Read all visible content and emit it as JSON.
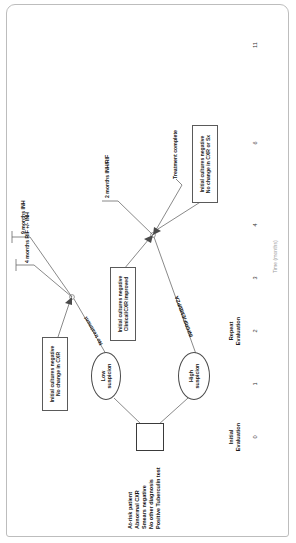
{
  "caption": {
    "text": "FIGURE 2. Treatment algorithm for suspected pulmonary tuberculosis with negative sputum smears"
  },
  "figure": {
    "orientation": "rotated-90-ccw"
  },
  "start": {
    "patient_criteria": "At-risk patient\nAbnormal CXR\nSmears negative\nNo other diagnosis\nPositive Tuberculin test"
  },
  "decisions": [
    {
      "id": "low",
      "label": "Low\nsuspicion"
    },
    {
      "id": "high",
      "label": "High\nsuspicion"
    }
  ],
  "paths": {
    "no_treatment": "No treatment",
    "initial_regimen": "INH/RIF/EMB/PZA",
    "two_months": "2 months INH/RIF",
    "four_months": "4 months RIF +/- INH",
    "nine_months": "9 months INH",
    "treatment_complete": "Treatment complete"
  },
  "outcome_boxes": [
    {
      "id": "low-outcome",
      "text": "Initial cultures negative\nNo change in CXR"
    },
    {
      "id": "repeat-outcome",
      "text": "Initial cultures negative\nNo change in CXR or Sx"
    },
    {
      "id": "high-outcome",
      "text": "Initial cultures negative\nClinical/CXR improved"
    }
  ],
  "axis": {
    "label": "Time (months)",
    "ticks": [
      "0",
      "1",
      "2",
      "3",
      "4",
      "6",
      "11"
    ],
    "evaluations": [
      {
        "label": "Initial\nEvaluation",
        "tick": "0"
      },
      {
        "label": "Repeat\nEvaluation",
        "tick": "2"
      }
    ]
  },
  "colors": {
    "stroke": "#6b6b6b",
    "box_border": "#5a5a5a",
    "text": "#1a1a1a",
    "muted": "#9a9a9a",
    "frame": "#bdbdbd"
  }
}
